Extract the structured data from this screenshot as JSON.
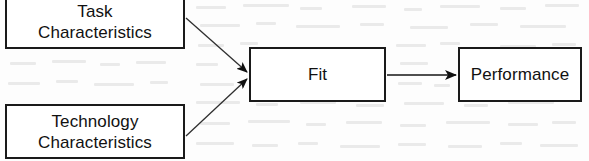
{
  "diagram": {
    "type": "flow-diagram",
    "stroke_color": "#1a1a1a",
    "background_color": "#fdfdfd",
    "nodes": [
      {
        "id": "task",
        "label": "Task\nCharacteristics",
        "shape": "rectangle"
      },
      {
        "id": "technology",
        "label": "Technology\nCharacteristics",
        "shape": "rectangle"
      },
      {
        "id": "fit",
        "label": "Fit",
        "shape": "rectangle"
      },
      {
        "id": "performance",
        "label": "Performance",
        "shape": "rectangle"
      }
    ],
    "edges": [
      {
        "from": "task",
        "to": "fit",
        "style": "arrow",
        "direction": "diagonal-down-right"
      },
      {
        "from": "technology",
        "to": "fit",
        "style": "arrow",
        "direction": "diagonal-up-right"
      },
      {
        "from": "fit",
        "to": "performance",
        "style": "arrow",
        "direction": "horizontal-right"
      }
    ]
  }
}
